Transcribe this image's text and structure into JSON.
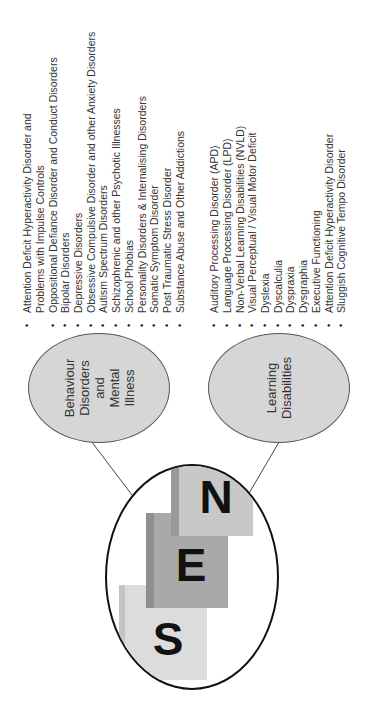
{
  "center": {
    "letters": [
      "S",
      "E",
      "N"
    ],
    "card_colors": {
      "s_card": "#dcdcdc",
      "e_card": "#a9a9a9",
      "n_card": "#c8c8c8"
    }
  },
  "branches": [
    {
      "label_lines": [
        "Behaviour",
        "Disorders",
        "and",
        "Mental",
        "Illness"
      ],
      "items": [
        "Attention Deficit Hyperactivity Disorder and",
        "Problems with Impulse Controls",
        "Oppositional Defiance Disorder and Conduct Disorders",
        "Bipolar Disorders",
        "Depressive Disorders",
        "Obsessive Compulsive  Disorder and other Anxiety Disorders",
        "Autism Spectrum Disorders",
        "Schizophrenic and other Psychotic Illnesses",
        "School Phobias",
        "Personality Disorders & Internalising Disorders",
        "Somatic Symptom Disorder",
        "Post Traumatic Stress Disorder",
        "Substance Abuse and Other Addictions"
      ],
      "bulleted": [
        true,
        false,
        true,
        true,
        true,
        true,
        true,
        true,
        true,
        true,
        true,
        true,
        true
      ]
    },
    {
      "label_lines": [
        "Learning",
        "Disabilities"
      ],
      "items": [
        "Auditory Processing Disorder (APD)",
        "Language Processing Disorder (LPD)",
        "Non-Verbal Learning Disabilities (NVLD)",
        "Visual Perceptual / Visual Motor Deficit",
        "Dyslexia",
        "Dyscalculia",
        "Dyspraxia",
        "Dysgraphia",
        "Executive Functioning",
        "Attention Deficit Hyperactivity Disorder",
        "Sluggish Cognitive Tempo Disorder"
      ],
      "bulleted": [
        true,
        true,
        true,
        true,
        true,
        true,
        true,
        true,
        true,
        true,
        true
      ]
    }
  ],
  "bullet_glyph": "•"
}
